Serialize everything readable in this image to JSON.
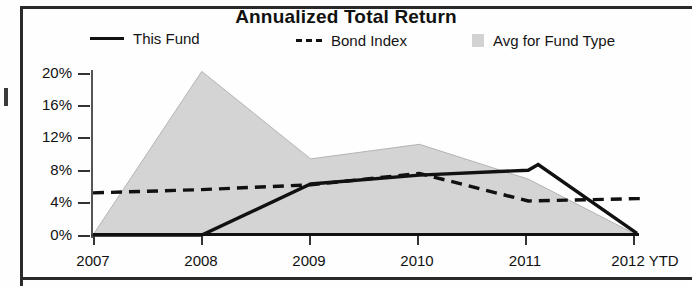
{
  "chart": {
    "title": "Annualized Total Return",
    "legend": [
      {
        "label": "This Fund",
        "marker": "solid-line",
        "color": "#111111"
      },
      {
        "label": "Bond Index",
        "marker": "dashed-line",
        "color": "#111111"
      },
      {
        "label": "Avg for Fund Type",
        "marker": "area-swatch",
        "color": "#d2d2d2"
      }
    ],
    "x_axis_suffix": "YTD"
  },
  "chart_data": {
    "type": "line",
    "title": "Annualized Total Return",
    "xlabel": "",
    "ylabel": "",
    "categories": [
      "2007",
      "2008",
      "2009",
      "2010",
      "2011",
      "2012 YTD"
    ],
    "ytick_labels": [
      "0%",
      "4%",
      "8%",
      "12%",
      "16%",
      "20%"
    ],
    "ytick_values": [
      0,
      4,
      8,
      12,
      16,
      20
    ],
    "ylim": [
      0,
      22
    ],
    "grid": false,
    "legend_position": "top",
    "series": [
      {
        "name": "This Fund",
        "style": "solid",
        "color": "#111111",
        "values": [
          0.0,
          0.0,
          6.3,
          7.4,
          8.0,
          0.2
        ],
        "peak": {
          "label": "8.7%",
          "value": 8.7,
          "near": "2011"
        }
      },
      {
        "name": "Bond Index",
        "style": "dashed",
        "color": "#111111",
        "values": [
          5.2,
          5.6,
          6.2,
          7.6,
          4.2,
          4.5
        ]
      },
      {
        "name": "Avg for Fund Type",
        "style": "area",
        "color": "#d2d2d2",
        "values": [
          0.0,
          20.2,
          9.4,
          11.2,
          6.9,
          0.0
        ]
      }
    ]
  }
}
